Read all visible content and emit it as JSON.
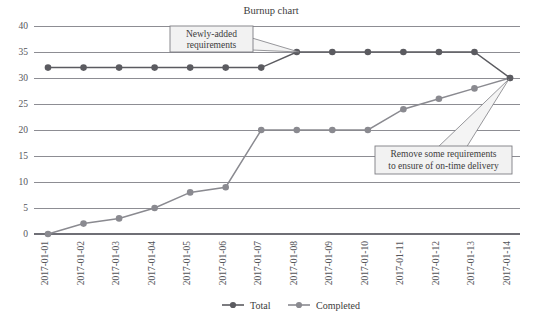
{
  "chart_data": {
    "type": "line",
    "title": "Burnup chart",
    "xlabel": "",
    "ylabel": "",
    "ylim": [
      0,
      40
    ],
    "yticks": [
      0,
      5,
      10,
      15,
      20,
      25,
      30,
      35,
      40
    ],
    "grid": true,
    "legend_position": "bottom",
    "categories": [
      "2017-01-01",
      "2017-01-02",
      "2017-01-03",
      "2017-01-04",
      "2017-01-05",
      "2017-01-06",
      "2017-01-07",
      "2017-01-08",
      "2017-01-09",
      "2017-01-10",
      "2017-01-11",
      "2017-01-12",
      "2017-01-13",
      "2017-01-14"
    ],
    "series": [
      {
        "name": "Total",
        "color": "#5b5b60",
        "values": [
          32,
          32,
          32,
          32,
          32,
          32,
          32,
          35,
          35,
          35,
          35,
          35,
          35,
          30
        ]
      },
      {
        "name": "Completed",
        "color": "#8a8a90",
        "values": [
          0,
          2,
          3,
          5,
          8,
          9,
          20,
          20,
          20,
          20,
          24,
          26,
          28,
          30
        ]
      }
    ],
    "annotations": [
      {
        "id": "annotation-newly-added",
        "lines": [
          "Newly-added",
          "requirements"
        ],
        "target_category": "2017-01-08",
        "target_series": "Total",
        "target_value": 35
      },
      {
        "id": "annotation-remove-requirements",
        "lines": [
          "Remove some requirements",
          "to ensure of on-time delivery"
        ],
        "target_category": "2017-01-14",
        "target_series": "Total",
        "target_value": 30
      }
    ]
  },
  "legend": {
    "items": [
      {
        "label": "Total",
        "color": "#5b5b60"
      },
      {
        "label": "Completed",
        "color": "#8a8a90"
      }
    ]
  },
  "axis": {
    "y_tick_labels": [
      "40",
      "35",
      "30",
      "25",
      "20",
      "15",
      "10",
      "5",
      "0"
    ],
    "x_tick_labels": [
      "2017-01-01",
      "2017-01-02",
      "2017-01-03",
      "2017-01-04",
      "2017-01-05",
      "2017-01-06",
      "2017-01-07",
      "2017-01-08",
      "2017-01-09",
      "2017-01-10",
      "2017-01-11",
      "2017-01-12",
      "2017-01-13",
      "2017-01-14"
    ]
  },
  "colors": {
    "total": "#5b5b60",
    "completed": "#8a8a90",
    "gridline": "#8d8d93",
    "callout_fill": "#f2f2f2",
    "callout_stroke": "#7d7d83",
    "text": "#3c3c3c"
  }
}
